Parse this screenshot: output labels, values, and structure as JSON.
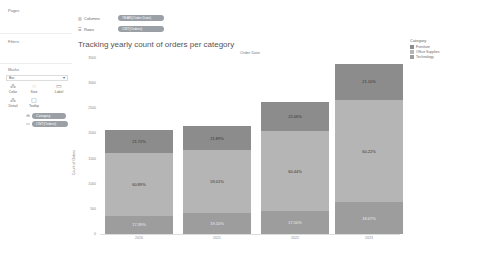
{
  "sidebar": {
    "pages_label": "Pages",
    "filters_label": "Filters",
    "marks_label": "Marks",
    "mark_type": "Bar",
    "mark_buttons": [
      {
        "label": "Color",
        "icon": "⁂"
      },
      {
        "label": "Size",
        "icon": "◌"
      },
      {
        "label": "Label",
        "icon": "▭"
      },
      {
        "label": "Detail",
        "icon": "⁂"
      },
      {
        "label": "Tooltip",
        "icon": "▢"
      }
    ],
    "mark_pills": [
      {
        "icon": "⁂",
        "label": "Category"
      },
      {
        "icon": "▭",
        "label": "CNT(Orders)"
      }
    ]
  },
  "shelves": {
    "columns_label": "Columns",
    "columns_pill": "YEAR(Order Date)",
    "rows_label": "Rows",
    "rows_pill": "CNT(Orders)"
  },
  "colors": {
    "furniture": "#8c8c8c",
    "office_supplies": "#b5b5b5",
    "technology": "#9d9d9d",
    "pill": "#9aa0a6"
  },
  "chart_data": {
    "type": "bar",
    "stacked": true,
    "title": "Tracking yearly count of orders per category",
    "header": "Order Date",
    "xlabel": "",
    "ylabel": "Count of Orders",
    "ylim": [
      0,
      3500
    ],
    "yticks": [
      0,
      500,
      1000,
      1500,
      2000,
      2500,
      3000,
      3500
    ],
    "ytick_labels": [
      "0",
      "500",
      "1000",
      "1500",
      "2000",
      "2500",
      "3000",
      "3500"
    ],
    "grid": false,
    "legend_position": "right",
    "legend_title": "Category",
    "categories": [
      "2020",
      "2021",
      "2022",
      "2023"
    ],
    "totals": [
      2060,
      2140,
      2620,
      3380
    ],
    "series": [
      {
        "name": "Technology",
        "percent_labels": [
          "17.39%",
          "19.10%",
          "17.50%",
          "18.67%"
        ],
        "percents": [
          17.39,
          19.1,
          17.5,
          18.67
        ]
      },
      {
        "name": "Office Supplies",
        "percent_labels": [
          "60.89%",
          "59.01%",
          "60.44%",
          "60.22%"
        ],
        "percents": [
          60.89,
          59.01,
          60.44,
          60.22
        ]
      },
      {
        "name": "Furniture",
        "percent_labels": [
          "21.72%",
          "21.89%",
          "22.06%",
          "21.10%"
        ],
        "percents": [
          21.72,
          21.89,
          22.06,
          21.1
        ]
      }
    ]
  }
}
